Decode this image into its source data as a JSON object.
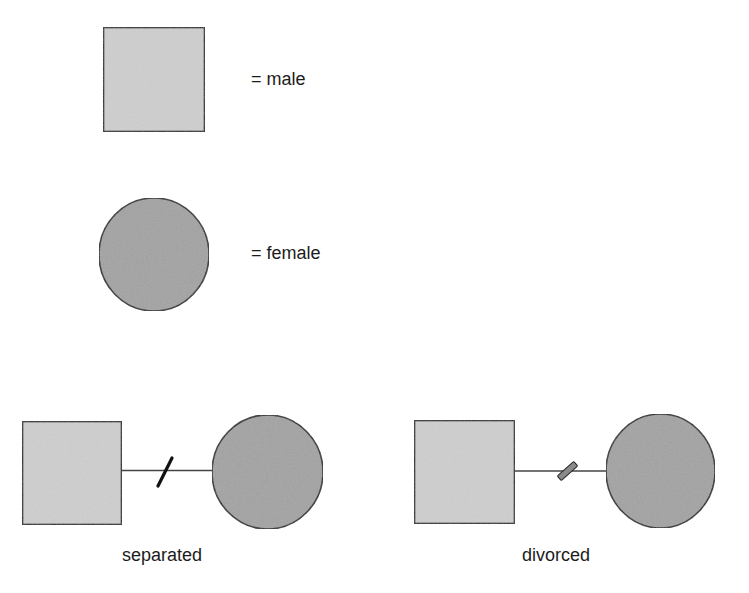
{
  "diagram": {
    "type": "genogram-legend",
    "colors": {
      "male_fill": "#cfcfcf",
      "female_fill": "#a3a3a3",
      "stroke": "#2a2a2a",
      "line": "#444444",
      "separated_mark": "#111111",
      "divorced_mark": "#8a8a8a",
      "background": "#ffffff"
    },
    "legend": [
      {
        "symbol": "square",
        "label": "= male"
      },
      {
        "symbol": "circle",
        "label": "= female"
      }
    ],
    "relationships": [
      {
        "name": "separated",
        "label": "separated",
        "mark": "single-slash"
      },
      {
        "name": "divorced",
        "label": "divorced",
        "mark": "filled-bar-slash"
      }
    ]
  }
}
